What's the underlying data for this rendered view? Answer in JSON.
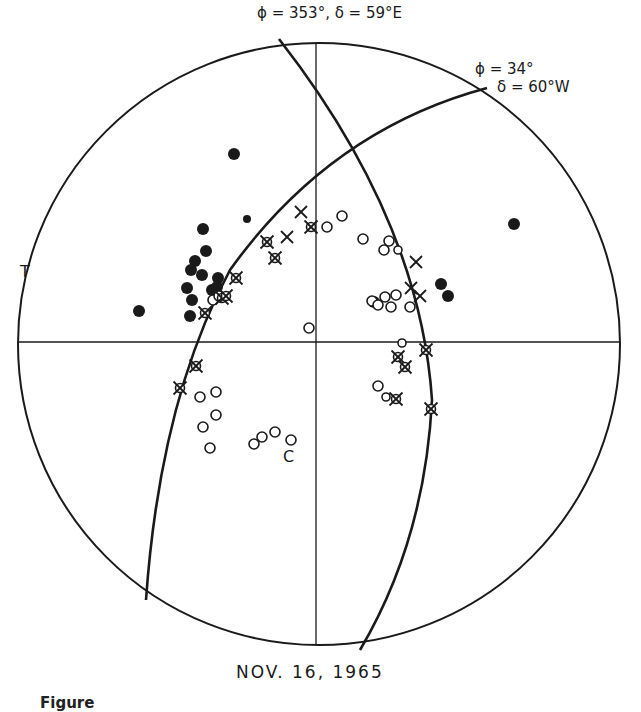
{
  "figure": {
    "date_label": "NOV. 16, 1965",
    "caption_fragment": "Figure",
    "plane1": {
      "label": "ϕ = 353°,  δ = 59°E",
      "strike": "353°",
      "dip": "59°E"
    },
    "plane2": {
      "label_phi": "ϕ = 34°",
      "label_delta": "δ = 60°W",
      "strike": "34°",
      "dip": "60°W"
    },
    "axis_T": "T",
    "axis_C": "C"
  },
  "colors": {
    "ink": "#1a1a1a",
    "background": "#ffffff"
  },
  "chart_data": {
    "type": "scatter",
    "title": "NOV. 16, 1965",
    "projection": "focal-mechanism stereonet (equal-area), pixel coords",
    "circle": {
      "cx": 319,
      "cy": 344,
      "r": 301
    },
    "nodal_planes": [
      {
        "name": "ϕ=353°, δ=59°E",
        "path": "M279,39 Q420,220 432,400 Q425,540 360,650"
      },
      {
        "name": "ϕ=34°, δ=60°W",
        "path": "M487,88 Q330,130 230,270 Q160,400 146,600"
      }
    ],
    "legend": [
      {
        "symbol": "filled-circle",
        "meaning": "compression"
      },
      {
        "symbol": "open-circle",
        "meaning": "dilatation"
      },
      {
        "symbol": "x",
        "meaning": "nodal / uncertain"
      },
      {
        "symbol": "circled-x",
        "meaning": "weak reading"
      }
    ],
    "series": [
      {
        "name": "filled",
        "points": [
          [
            234,
            154,
            6
          ],
          [
            247,
            219,
            4
          ],
          [
            203,
            229,
            6
          ],
          [
            206,
            251,
            6
          ],
          [
            195,
            261,
            6
          ],
          [
            191,
            270,
            6
          ],
          [
            202,
            275,
            6
          ],
          [
            218,
            278,
            6
          ],
          [
            187,
            288,
            6
          ],
          [
            212,
            290,
            6
          ],
          [
            192,
            300,
            6
          ],
          [
            190,
            316,
            6
          ],
          [
            139,
            311,
            6
          ],
          [
            217,
            287,
            6
          ],
          [
            514,
            224,
            6
          ],
          [
            441,
            284,
            6
          ],
          [
            448,
            296,
            6
          ],
          [
            374,
            302,
            6
          ]
        ]
      },
      {
        "name": "open",
        "points": [
          [
            342,
            216,
            5
          ],
          [
            327,
            227,
            5
          ],
          [
            363,
            239,
            5
          ],
          [
            389,
            241,
            5
          ],
          [
            384,
            250,
            5
          ],
          [
            398,
            250,
            4
          ],
          [
            372,
            301,
            5
          ],
          [
            378,
            305,
            5
          ],
          [
            385,
            297,
            5
          ],
          [
            396,
            295,
            5
          ],
          [
            391,
            307,
            5
          ],
          [
            410,
            307,
            5
          ],
          [
            309,
            328,
            5
          ],
          [
            402,
            343,
            4
          ],
          [
            378,
            386,
            5
          ],
          [
            386,
            397,
            4
          ],
          [
            200,
            397,
            5
          ],
          [
            216,
            392,
            5
          ],
          [
            216,
            415,
            5
          ],
          [
            203,
            427,
            5
          ],
          [
            210,
            448,
            5
          ],
          [
            254,
            444,
            5
          ],
          [
            262,
            437,
            5
          ],
          [
            275,
            432,
            5
          ],
          [
            291,
            440,
            5
          ],
          [
            213,
            300,
            5
          ],
          [
            219,
            296,
            5
          ]
        ]
      },
      {
        "name": "x",
        "points": [
          [
            301,
            212
          ],
          [
            287,
            237
          ],
          [
            416,
            262
          ],
          [
            411,
            288
          ],
          [
            420,
            296
          ]
        ]
      },
      {
        "name": "circled-x",
        "points": [
          [
            311,
            227
          ],
          [
            267,
            242
          ],
          [
            275,
            258
          ],
          [
            236,
            278
          ],
          [
            222,
            298
          ],
          [
            205,
            313
          ],
          [
            196,
            366
          ],
          [
            180,
            388
          ],
          [
            398,
            357
          ],
          [
            405,
            367
          ],
          [
            426,
            350
          ],
          [
            396,
            399
          ],
          [
            431,
            409
          ],
          [
            226,
            296
          ]
        ]
      }
    ]
  }
}
